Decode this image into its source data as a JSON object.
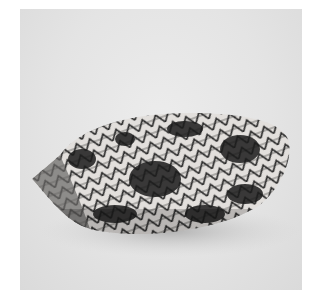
{
  "image": {
    "subject": "cone shell",
    "description": "Grayscale photograph of a textile-pattern cone shell lying horizontally on a light gray background",
    "colors": {
      "background": "#e6e6e6",
      "frame": "#ffffff",
      "shell_light": "#e8e4e0",
      "shell_dark": "#1e1e1e",
      "shadow": "#b8b8b8"
    }
  }
}
